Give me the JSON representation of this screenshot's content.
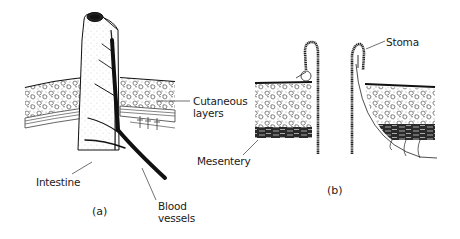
{
  "figure": {
    "panel_a": {
      "label": "(a)",
      "callouts": {
        "cutaneous_line1": "Cutaneous",
        "cutaneous_line2": "layers",
        "intestine": "Intestine",
        "blood_line1": "Blood",
        "blood_line2": "vessels"
      }
    },
    "panel_b": {
      "label": "(b)",
      "callouts": {
        "stoma": "Stoma",
        "mesentery": "Mesentery"
      }
    }
  },
  "colors": {
    "ink": "#1a1a1a",
    "background": "#ffffff"
  }
}
